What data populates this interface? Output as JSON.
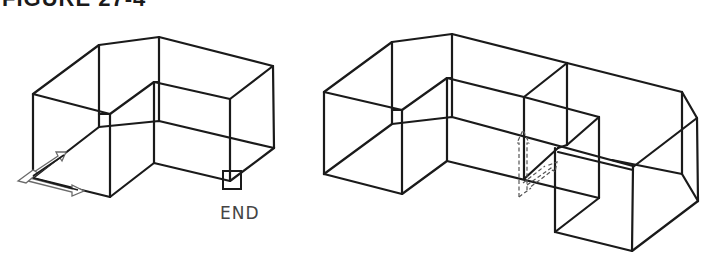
{
  "figure": {
    "title": "FIGURE 27-4",
    "title_partially_visible": true
  },
  "left_drawing": {
    "description": "Isometric wireframe L-shaped solid with UCS icon at lower-left and endpoint osnap marker",
    "snap_marker_label": "END",
    "snap_marker_type": "endpoint-box",
    "ucs_icon_style": "solid-outline-3d-arrows"
  },
  "right_drawing": {
    "description": "Isometric wireframe extended solid (L-shape plus appended box) with dashed UCS icon at new origin",
    "ucs_icon_style": "dashed-3d-arrows"
  },
  "colors": {
    "line": "#1a1a1a",
    "ucs_icon": "#6a6a6a",
    "label": "#444444",
    "background": "#ffffff"
  }
}
